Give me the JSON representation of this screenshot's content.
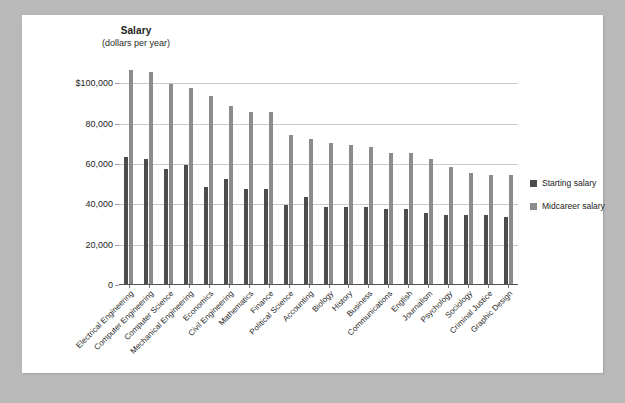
{
  "chart_data": {
    "type": "bar",
    "title": "Salary",
    "subtitle": "(dollars per year)",
    "xlabel": "",
    "ylabel": "Salary (dollars per year)",
    "ylim": [
      0,
      110000
    ],
    "grid": true,
    "legend_position": "right",
    "yticks": [
      0,
      20000,
      40000,
      60000,
      80000,
      100000
    ],
    "ytick_labels": [
      "0",
      "20,000",
      "40,000",
      "60,000",
      "80,000",
      "$100,000"
    ],
    "categories": [
      "Electrical Engineering",
      "Computer Engineering",
      "Computer Science",
      "Mechanical Engineering",
      "Economics",
      "Civil Engineering",
      "Mathematics",
      "Finance",
      "Political Science",
      "Accounting",
      "Biology",
      "History",
      "Business",
      "Communications",
      "English",
      "Journalism",
      "Psychology",
      "Sociology",
      "Criminal Justice",
      "Graphic Design"
    ],
    "series": [
      {
        "name": "Starting salary",
        "color": "#4c4c4c",
        "values": [
          63000,
          62000,
          57000,
          59000,
          48000,
          52000,
          47000,
          47000,
          39000,
          43000,
          38000,
          38000,
          38000,
          37000,
          37000,
          35000,
          34000,
          34000,
          34000,
          33000
        ]
      },
      {
        "name": "Midcareer salary",
        "color": "#8c8c8c",
        "values": [
          106000,
          105000,
          99000,
          97000,
          93000,
          88000,
          85000,
          85000,
          74000,
          72000,
          70000,
          69000,
          68000,
          65000,
          65000,
          62000,
          58000,
          55000,
          54000,
          54000
        ]
      }
    ]
  },
  "legend": {
    "items": [
      {
        "label": "Starting salary",
        "color": "#4c4c4c"
      },
      {
        "label": "Midcareer salary",
        "color": "#8c8c8c"
      }
    ]
  },
  "colors": {
    "page_background": "#b9b9b9",
    "canvas": "#ffffff",
    "gridline": "#c9c9c9",
    "axis": "#555555",
    "starting_bar": "#4c4c4c",
    "midcareer_bar": "#8c8c8c"
  }
}
